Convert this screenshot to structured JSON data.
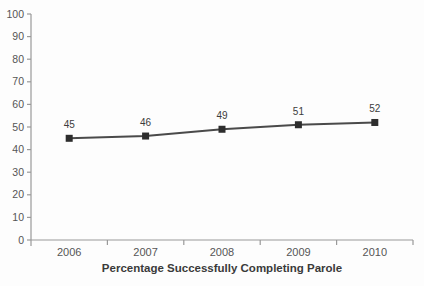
{
  "chart_data": {
    "type": "line",
    "categories": [
      "2006",
      "2007",
      "2008",
      "2009",
      "2010"
    ],
    "values": [
      45,
      46,
      49,
      51,
      52
    ],
    "data_labels": [
      "45",
      "46",
      "49",
      "51",
      "52"
    ],
    "title": "",
    "xlabel": "Percentage Successfully Completing Parole",
    "ylabel": "",
    "ylim": [
      0,
      100
    ],
    "ytick_step": 10,
    "ytick_labels": [
      "0",
      "10",
      "20",
      "30",
      "40",
      "50",
      "60",
      "70",
      "80",
      "90",
      "100"
    ],
    "grid": "off",
    "legend": "none",
    "marker_shape": "square",
    "colors": {
      "line": "#4a4a4a",
      "marker": "#2d2d2d",
      "axis": "#999999",
      "tick_label": "#555555",
      "data_label": "#3c3c3c",
      "axis_title": "#3a3a3a",
      "background": "#fdfdfd"
    }
  }
}
